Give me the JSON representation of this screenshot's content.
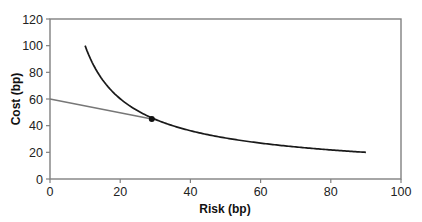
{
  "chart_data": {
    "type": "line",
    "title": "",
    "xlabel": "Risk (bp)",
    "ylabel": "Cost (bp)",
    "xlim": [
      0,
      100
    ],
    "ylim": [
      0,
      120
    ],
    "xticks": [
      0,
      20,
      40,
      60,
      80,
      100
    ],
    "yticks": [
      0,
      20,
      40,
      60,
      80,
      100,
      120
    ],
    "grid": false,
    "legend": null,
    "series": [
      {
        "name": "efficient frontier curve",
        "color": "#1a1a1a",
        "x": [
          10,
          15,
          20,
          25,
          29,
          35,
          40,
          50,
          60,
          70,
          80,
          90
        ],
        "y": [
          100,
          74.3,
          60.2,
          51.2,
          45.9,
          39.8,
          36.2,
          30.8,
          26.9,
          24.0,
          21.8,
          20.0
        ]
      },
      {
        "name": "line to optimal point",
        "color": "#777777",
        "x": [
          0,
          29
        ],
        "y": [
          60,
          45
        ]
      }
    ],
    "annotations": [
      {
        "type": "point",
        "x": 29,
        "y": 45,
        "label": ""
      }
    ]
  }
}
